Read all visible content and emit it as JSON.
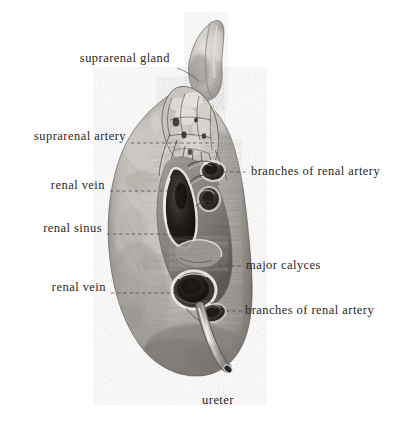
{
  "plate": {
    "subject": "right kidney with suprarenal gland, hilum dissected",
    "background_color": "#ffffff",
    "label_color": "#2b2724",
    "leader_color": "#4a4440",
    "width": 405,
    "height": 431
  },
  "labels": [
    {
      "id": "suprarenal-gland",
      "text": "suprarenal gland",
      "align": "right",
      "x": 68,
      "y": 59,
      "leader": {
        "type": "curve",
        "points": "177,68 191,74 198,80"
      }
    },
    {
      "id": "suprarenal-artery",
      "text": "suprarenal artery",
      "align": "right",
      "x": 18,
      "y": 137,
      "leader": {
        "type": "dashed",
        "points": "131,143 214,143"
      }
    },
    {
      "id": "renal-vein-upper",
      "text": "renal vein",
      "align": "right",
      "x": 48,
      "y": 186,
      "leader": {
        "type": "dashed",
        "points": "110,191 172,191"
      }
    },
    {
      "id": "renal-sinus",
      "text": "renal sinus",
      "align": "right",
      "x": 36,
      "y": 229,
      "leader": {
        "type": "dashed",
        "points": "107,234 173,234"
      }
    },
    {
      "id": "renal-vein-lower",
      "text": "renal vein",
      "align": "right",
      "x": 46,
      "y": 288,
      "leader": {
        "type": "dashed",
        "points": "111,293 178,293"
      }
    },
    {
      "id": "branches-of-renal-artery-upper",
      "text": "branches of renal artery",
      "align": "left",
      "x": 251,
      "y": 167,
      "leader": {
        "type": "dashed",
        "points": "224,172 249,172"
      }
    },
    {
      "id": "major-calyces",
      "text": "major calyces",
      "align": "left",
      "x": 246,
      "y": 261,
      "leader": {
        "type": "dashed",
        "points": "219,266 243,266"
      }
    },
    {
      "id": "branches-of-renal-artery-lower",
      "text": "branches of renal artery",
      "align": "left",
      "x": 245,
      "y": 306,
      "leader": {
        "type": "dashed",
        "points": "220,311 243,311"
      }
    },
    {
      "id": "ureter",
      "text": "ureter",
      "align": "center",
      "x": 213,
      "y": 396,
      "leader": {
        "type": "none",
        "points": ""
      }
    }
  ],
  "specimen": {
    "outline_fill": "#b8b4ae",
    "shadow_color": "#6f6a65",
    "highlight_color": "#e4e1dc",
    "structures": [
      {
        "id": "suprarenal-gland-body",
        "kind": "gland",
        "tone": "#cfccc6"
      },
      {
        "id": "kidney-cortex",
        "kind": "parenchyma",
        "tone": "#b2aea8"
      },
      {
        "id": "renal-vein-opening-upper",
        "kind": "vessel-lumen",
        "tone": "#1d1b19"
      },
      {
        "id": "renal-artery-branch-opening-a",
        "kind": "vessel-lumen",
        "tone": "#262320"
      },
      {
        "id": "renal-artery-branch-opening-b",
        "kind": "vessel-lumen",
        "tone": "#2a2724"
      },
      {
        "id": "renal-vein-opening-lower",
        "kind": "vessel-lumen",
        "tone": "#3a3430"
      },
      {
        "id": "renal-artery-branch-opening-c",
        "kind": "vessel-lumen",
        "tone": "#241f1c"
      },
      {
        "id": "major-calyx",
        "kind": "calyx",
        "tone": "#8e8984"
      },
      {
        "id": "ureter-tube",
        "kind": "tube",
        "tone": "#d8d4ce"
      }
    ]
  }
}
